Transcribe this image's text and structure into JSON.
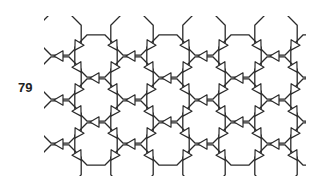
{
  "figure": {
    "label": "79",
    "stroke_color": "#2a2a2a",
    "background": "#ffffff"
  },
  "lattice": {
    "octagon_radius": 23,
    "columns_x": [
      60,
      96,
      132,
      168,
      204,
      240,
      276,
      312
    ],
    "even_rows_y": [
      56,
      100,
      144
    ],
    "odd_rows_y": [
      34,
      78,
      122,
      166
    ],
    "clip": {
      "x0": 48,
      "y0": 18,
      "x1": 300,
      "y1": 172
    }
  }
}
